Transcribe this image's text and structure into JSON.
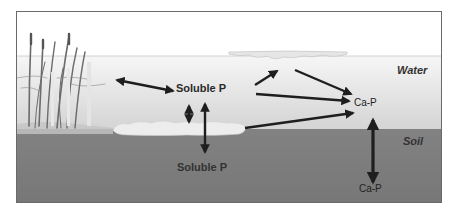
{
  "diagram": {
    "type": "phosphorus-cycle-wetland",
    "zones": {
      "water_label": "Water",
      "soil_label": "Soil"
    },
    "labels": {
      "soluble_p_water": "Soluble P",
      "soluble_p_soil": "Soluble P",
      "ca_p_water": "Ca-P",
      "ca_p_soil": "Ca-P"
    },
    "elements": [
      {
        "id": "plants",
        "description": "emergent wetland vegetation (cattails/reeds) at left"
      },
      {
        "id": "algae-mat",
        "description": "floating periphyton/algae mat at water surface"
      },
      {
        "id": "sediment-floc",
        "description": "light floc/sediment layer at water-soil interface"
      }
    ],
    "arrows": [
      {
        "from": "plants",
        "to": "soluble_p_water",
        "type": "bidirectional"
      },
      {
        "from": "soluble_p_water",
        "to": "sediment-floc",
        "type": "bidirectional-short"
      },
      {
        "from": "soluble_p_water",
        "to": "soluble_p_soil",
        "type": "bidirectional-long"
      },
      {
        "from": "soluble_p_water",
        "to": "algae-mat",
        "type": "unidirectional"
      },
      {
        "from": "algae-mat",
        "to": "ca_p_water",
        "type": "unidirectional"
      },
      {
        "from": "soluble_p_water",
        "to": "ca_p_water",
        "type": "unidirectional"
      },
      {
        "from": "sediment-floc",
        "to": "ca_p_water",
        "type": "unidirectional"
      },
      {
        "from": "ca_p_water",
        "to": "ca_p_soil",
        "type": "bidirectional"
      }
    ],
    "colors": {
      "air": "#ffffff",
      "water_top": "#f4f4f4",
      "water_bottom": "#d6d6d6",
      "soil": "#7d7d7d",
      "arrow": "#1e1e1e",
      "frame": "#6a6a6a"
    }
  }
}
